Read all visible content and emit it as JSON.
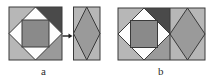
{
  "figure": {
    "kind": "geometric-dissection-diagram",
    "caption_a": "a",
    "caption_b": "b",
    "arrow_glyph": "→"
  },
  "palette": {
    "background": "#ffffff",
    "outline": "#3a3a3a",
    "white_piece": "#fdfdfd",
    "light_gray": "#b7b7b7",
    "mid_gray": "#9a9a9a",
    "mid_dark_gray": "#8a8a8a",
    "dark_gray": "#555555",
    "darker_gray": "#4a4a4a",
    "label_color": "#2b2b2b"
  },
  "panel_a": {
    "name": "panel-a",
    "source_square": {
      "name": "source-square-a",
      "x": 9,
      "y": 7,
      "w": 53,
      "h": 53,
      "pieces": [
        {
          "id": "corner-top-left",
          "shape": "triangle",
          "fill": "#b7b7b7"
        },
        {
          "id": "corner-top-right",
          "shape": "triangle",
          "fill": "#4a4a4a"
        },
        {
          "id": "corner-bottom-left",
          "shape": "triangle",
          "fill": "#b7b7b7"
        },
        {
          "id": "corner-bottom-right",
          "shape": "triangle",
          "fill": "#9a9a9a"
        },
        {
          "id": "edge-top",
          "shape": "triangle",
          "fill": "#fdfdfd"
        },
        {
          "id": "edge-left",
          "shape": "triangle",
          "fill": "#fdfdfd"
        },
        {
          "id": "edge-right",
          "shape": "triangle",
          "fill": "#fdfdfd"
        },
        {
          "id": "edge-bottom",
          "shape": "triangle",
          "fill": "#fdfdfd"
        },
        {
          "id": "center-square",
          "shape": "square",
          "fill": "#8a8a8a"
        }
      ]
    },
    "arrow": {
      "name": "transform-arrow-a",
      "x": 62,
      "y": 34,
      "w": 11,
      "h": 6
    },
    "target_rect": {
      "name": "target-rhombus-a",
      "x": 73,
      "y": 7,
      "w": 27,
      "h": 53,
      "pieces": [
        {
          "id": "rhombus-body",
          "shape": "rhombus",
          "fill": "#9a9a9a"
        },
        {
          "id": "side-left-top",
          "shape": "triangle",
          "fill": "#b7b7b7"
        },
        {
          "id": "side-right-top",
          "shape": "triangle",
          "fill": "#b7b7b7"
        },
        {
          "id": "side-left-bottom",
          "shape": "triangle",
          "fill": "#b7b7b7"
        },
        {
          "id": "side-right-bottom",
          "shape": "triangle",
          "fill": "#b7b7b7"
        }
      ]
    }
  },
  "panel_b": {
    "name": "panel-b",
    "combined_rect": {
      "name": "combined-rect-b",
      "x": 118,
      "y": 8,
      "w": 87,
      "h": 52,
      "left_half": {
        "name": "square-half-b",
        "pieces": [
          {
            "id": "corner-top-left",
            "shape": "triangle",
            "fill": "#b7b7b7"
          },
          {
            "id": "corner-top-right",
            "shape": "triangle",
            "fill": "#4a4a4a"
          },
          {
            "id": "corner-bottom-left",
            "shape": "triangle",
            "fill": "#b7b7b7"
          },
          {
            "id": "corner-bottom-right",
            "shape": "triangle",
            "fill": "#9a9a9a"
          },
          {
            "id": "edge-top",
            "shape": "triangle",
            "fill": "#fdfdfd"
          },
          {
            "id": "edge-left",
            "shape": "triangle",
            "fill": "#fdfdfd"
          },
          {
            "id": "edge-right",
            "shape": "triangle",
            "fill": "#fdfdfd"
          },
          {
            "id": "edge-bottom",
            "shape": "triangle",
            "fill": "#fdfdfd"
          },
          {
            "id": "center-square",
            "shape": "square",
            "fill": "#8a8a8a"
          }
        ]
      },
      "right_half": {
        "name": "rhombus-half-b",
        "pieces": [
          {
            "id": "rhombus-body",
            "shape": "rhombus",
            "fill": "#9a9a9a"
          },
          {
            "id": "side-left-top",
            "shape": "triangle",
            "fill": "#b7b7b7"
          },
          {
            "id": "side-right-top",
            "shape": "triangle",
            "fill": "#b7b7b7"
          },
          {
            "id": "side-left-bottom",
            "shape": "triangle",
            "fill": "#b7b7b7"
          },
          {
            "id": "side-right-bottom",
            "shape": "triangle",
            "fill": "#b7b7b7"
          }
        ]
      }
    }
  }
}
